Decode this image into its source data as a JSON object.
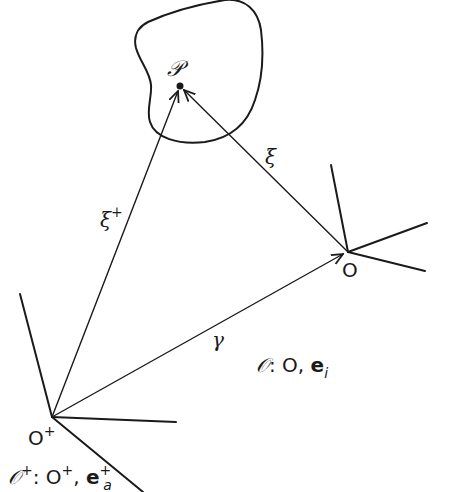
{
  "diagram": {
    "type": "vector-geometry",
    "colors": {
      "ink": "#1a1a1a",
      "background": "#ffffff"
    },
    "body": {
      "label": "𝒫",
      "point": [
        180,
        86
      ]
    },
    "frames": [
      {
        "id": "O",
        "origin_label": "O",
        "origin": [
          348,
          252
        ],
        "frame_label": {
          "script": "𝒪",
          "rest": ": O, ",
          "basis": "e",
          "subscript": "i"
        }
      },
      {
        "id": "O-plus",
        "origin_label": "O",
        "origin_sup": "+",
        "origin": [
          52,
          417
        ],
        "frame_label": {
          "script": "𝒪",
          "script_sup": "+",
          "rest": ": O",
          "rest_sup": "+",
          "comma": ", ",
          "basis": "e",
          "basis_sup": "+",
          "subscript": "a"
        }
      }
    ],
    "vectors": [
      {
        "name": "xi-plus",
        "label": "ξ",
        "label_sup": "+",
        "from": "O-plus",
        "to": "P"
      },
      {
        "name": "xi",
        "label": "ξ",
        "from": "O",
        "to": "P"
      },
      {
        "name": "gamma",
        "label": "γ",
        "from": "O-plus",
        "to": "O"
      }
    ]
  }
}
